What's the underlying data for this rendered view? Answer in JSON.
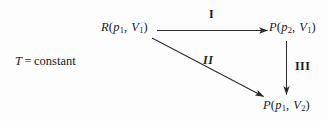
{
  "diagram": {
    "condition": {
      "symbol": "T",
      "operator": "=",
      "value": "constant",
      "full_text": "T = constant"
    },
    "nodes": [
      {
        "id": "source",
        "function": "R",
        "arg1_base": "p",
        "arg1_sub": "1",
        "arg2_base": "V",
        "arg2_sub": "1",
        "full_text": "R(p1, V1)"
      },
      {
        "id": "top-right",
        "function": "P",
        "arg1_base": "p",
        "arg1_sub": "2",
        "arg2_base": "V",
        "arg2_sub": "1",
        "full_text": "P(p2, V1)"
      },
      {
        "id": "bottom-right",
        "function": "P",
        "arg1_base": "p",
        "arg1_sub": "1",
        "arg2_base": "V",
        "arg2_sub": "2",
        "full_text": "P(p1, V2)"
      }
    ],
    "edges": [
      {
        "id": "edge-i",
        "label": "I",
        "from": "source",
        "to": "top-right",
        "style": "horizontal"
      },
      {
        "id": "edge-ii",
        "label": "II",
        "from": "source",
        "to": "bottom-right",
        "style": "diagonal"
      },
      {
        "id": "edge-iii",
        "label": "III",
        "from": "top-right",
        "to": "bottom-right",
        "style": "vertical"
      }
    ],
    "colors": {
      "background": "#fdfdfd",
      "ink": "#1a1a1a",
      "arrow": "#2b2b2b"
    },
    "punctuation": {
      "open_paren": "(",
      "close_paren": ")",
      "comma": ","
    }
  }
}
